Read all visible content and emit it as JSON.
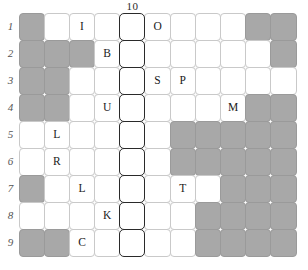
{
  "puzzle": {
    "columns": 11,
    "rows": 9,
    "column_header": {
      "label": "10",
      "column_index": 5
    },
    "row_labels": [
      "1",
      "2",
      "3",
      "4",
      "5",
      "6",
      "7",
      "8",
      "9"
    ],
    "colors": {
      "shaded_cell": "#a8a8a8",
      "empty_cell": "#ffffff",
      "grid_line": "#c9c9c9",
      "highlight_border": "#2a2a2a",
      "letter": "#1a1a1a",
      "row_label": "#555555"
    },
    "highlight_column": 5,
    "cells": [
      [
        {
          "state": "shaded",
          "letter": ""
        },
        {
          "state": "empty",
          "letter": ""
        },
        {
          "state": "empty",
          "letter": "I"
        },
        {
          "state": "empty",
          "letter": ""
        },
        {
          "state": "highlight",
          "letter": ""
        },
        {
          "state": "empty",
          "letter": "O"
        },
        {
          "state": "empty",
          "letter": ""
        },
        {
          "state": "empty",
          "letter": ""
        },
        {
          "state": "empty",
          "letter": ""
        },
        {
          "state": "shaded",
          "letter": ""
        },
        {
          "state": "shaded",
          "letter": ""
        }
      ],
      [
        {
          "state": "shaded",
          "letter": ""
        },
        {
          "state": "shaded",
          "letter": ""
        },
        {
          "state": "shaded",
          "letter": ""
        },
        {
          "state": "empty",
          "letter": "B"
        },
        {
          "state": "highlight",
          "letter": ""
        },
        {
          "state": "empty",
          "letter": ""
        },
        {
          "state": "empty",
          "letter": ""
        },
        {
          "state": "empty",
          "letter": ""
        },
        {
          "state": "empty",
          "letter": ""
        },
        {
          "state": "empty",
          "letter": ""
        },
        {
          "state": "shaded",
          "letter": ""
        }
      ],
      [
        {
          "state": "shaded",
          "letter": ""
        },
        {
          "state": "shaded",
          "letter": ""
        },
        {
          "state": "empty",
          "letter": ""
        },
        {
          "state": "empty",
          "letter": ""
        },
        {
          "state": "highlight",
          "letter": ""
        },
        {
          "state": "empty",
          "letter": "S"
        },
        {
          "state": "empty",
          "letter": "P"
        },
        {
          "state": "empty",
          "letter": ""
        },
        {
          "state": "empty",
          "letter": ""
        },
        {
          "state": "empty",
          "letter": ""
        },
        {
          "state": "empty",
          "letter": ""
        }
      ],
      [
        {
          "state": "shaded",
          "letter": ""
        },
        {
          "state": "shaded",
          "letter": ""
        },
        {
          "state": "empty",
          "letter": ""
        },
        {
          "state": "empty",
          "letter": "U"
        },
        {
          "state": "highlight",
          "letter": ""
        },
        {
          "state": "empty",
          "letter": ""
        },
        {
          "state": "empty",
          "letter": ""
        },
        {
          "state": "empty",
          "letter": ""
        },
        {
          "state": "empty",
          "letter": "M"
        },
        {
          "state": "shaded",
          "letter": ""
        },
        {
          "state": "shaded",
          "letter": ""
        }
      ],
      [
        {
          "state": "empty",
          "letter": ""
        },
        {
          "state": "empty",
          "letter": "L"
        },
        {
          "state": "empty",
          "letter": ""
        },
        {
          "state": "empty",
          "letter": ""
        },
        {
          "state": "highlight",
          "letter": ""
        },
        {
          "state": "empty",
          "letter": ""
        },
        {
          "state": "shaded",
          "letter": ""
        },
        {
          "state": "shaded",
          "letter": ""
        },
        {
          "state": "shaded",
          "letter": ""
        },
        {
          "state": "shaded",
          "letter": ""
        },
        {
          "state": "shaded",
          "letter": ""
        }
      ],
      [
        {
          "state": "empty",
          "letter": ""
        },
        {
          "state": "empty",
          "letter": "R"
        },
        {
          "state": "empty",
          "letter": ""
        },
        {
          "state": "empty",
          "letter": ""
        },
        {
          "state": "highlight",
          "letter": ""
        },
        {
          "state": "empty",
          "letter": ""
        },
        {
          "state": "shaded",
          "letter": ""
        },
        {
          "state": "shaded",
          "letter": ""
        },
        {
          "state": "shaded",
          "letter": ""
        },
        {
          "state": "shaded",
          "letter": ""
        },
        {
          "state": "shaded",
          "letter": ""
        }
      ],
      [
        {
          "state": "shaded",
          "letter": ""
        },
        {
          "state": "empty",
          "letter": ""
        },
        {
          "state": "empty",
          "letter": "L"
        },
        {
          "state": "empty",
          "letter": ""
        },
        {
          "state": "highlight",
          "letter": ""
        },
        {
          "state": "empty",
          "letter": ""
        },
        {
          "state": "empty",
          "letter": "T"
        },
        {
          "state": "empty",
          "letter": ""
        },
        {
          "state": "shaded",
          "letter": ""
        },
        {
          "state": "shaded",
          "letter": ""
        },
        {
          "state": "shaded",
          "letter": ""
        }
      ],
      [
        {
          "state": "empty",
          "letter": ""
        },
        {
          "state": "empty",
          "letter": ""
        },
        {
          "state": "empty",
          "letter": ""
        },
        {
          "state": "empty",
          "letter": "K"
        },
        {
          "state": "highlight",
          "letter": ""
        },
        {
          "state": "empty",
          "letter": ""
        },
        {
          "state": "empty",
          "letter": ""
        },
        {
          "state": "shaded",
          "letter": ""
        },
        {
          "state": "shaded",
          "letter": ""
        },
        {
          "state": "shaded",
          "letter": ""
        },
        {
          "state": "shaded",
          "letter": ""
        }
      ],
      [
        {
          "state": "shaded",
          "letter": ""
        },
        {
          "state": "shaded",
          "letter": ""
        },
        {
          "state": "empty",
          "letter": "C"
        },
        {
          "state": "empty",
          "letter": ""
        },
        {
          "state": "highlight",
          "letter": ""
        },
        {
          "state": "empty",
          "letter": ""
        },
        {
          "state": "empty",
          "letter": ""
        },
        {
          "state": "shaded",
          "letter": ""
        },
        {
          "state": "shaded",
          "letter": ""
        },
        {
          "state": "shaded",
          "letter": ""
        },
        {
          "state": "shaded",
          "letter": ""
        }
      ]
    ]
  }
}
